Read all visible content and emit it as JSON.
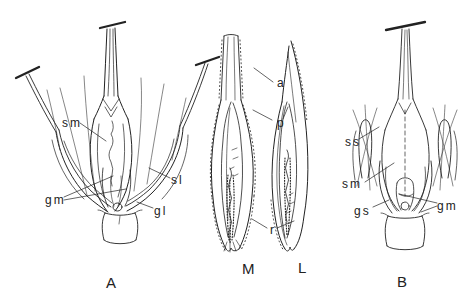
{
  "canvas": {
    "background": "#ffffff",
    "ink": "#222222"
  },
  "panels": {
    "A": {
      "caption": "A",
      "labels": {
        "sm": "sm",
        "sl": "sl",
        "gm": "gm",
        "gl": "gl"
      }
    },
    "M": {
      "caption": "M",
      "labels": {
        "a": "a",
        "p": "p",
        "r": "r"
      }
    },
    "L": {
      "caption": "L"
    },
    "B": {
      "caption": "B",
      "labels": {
        "ss": "ss",
        "sm": "sm",
        "gs": "gs",
        "gm": "gm"
      }
    }
  }
}
